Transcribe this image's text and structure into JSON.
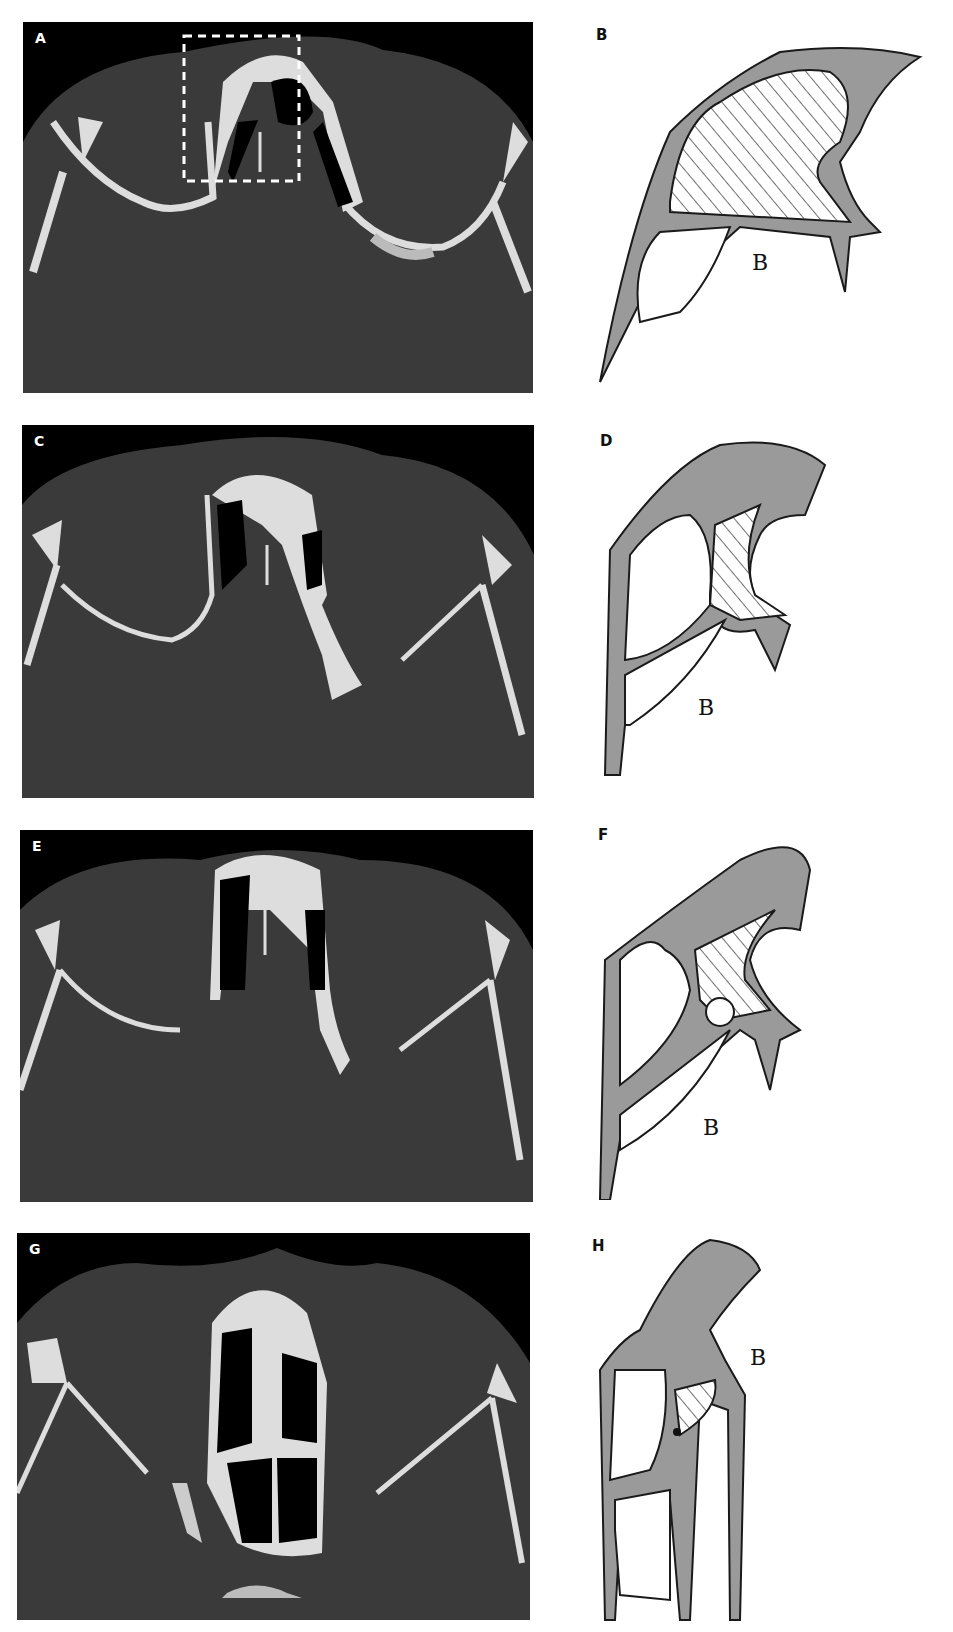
{
  "figure": {
    "panels": [
      {
        "id": "A",
        "type": "ct-scan",
        "label": "A",
        "has_roi_box": true
      },
      {
        "id": "B",
        "type": "drawing",
        "label": "B",
        "annotation": "B"
      },
      {
        "id": "C",
        "type": "ct-scan",
        "label": "C"
      },
      {
        "id": "D",
        "type": "drawing",
        "label": "D",
        "annotation": "B"
      },
      {
        "id": "E",
        "type": "ct-scan",
        "label": "E"
      },
      {
        "id": "F",
        "type": "drawing",
        "label": "F",
        "annotation": "B"
      },
      {
        "id": "G",
        "type": "ct-scan",
        "label": "G"
      },
      {
        "id": "H",
        "type": "drawing",
        "label": "H",
        "annotation": "B"
      }
    ],
    "colors": {
      "ct_background": "#000000",
      "ct_soft_tissue": "#3a3a3a",
      "ct_bone": "#e6e6e6",
      "roi_box": "#ffffff",
      "drawing_ink": "#1a1a1a",
      "drawing_shade": "#9a9a9a"
    }
  }
}
